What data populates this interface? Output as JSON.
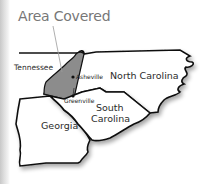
{
  "title": "Area Covered",
  "states": {
    "tennessee": "Tennessee",
    "north_carolina": "North Carolina",
    "south_carolina_1": "South",
    "south_carolina_2": "Carolina",
    "georgia": "Georgia"
  },
  "cities": {
    "asheville": "Asheville",
    "greenville": "Greenville"
  },
  "colors": {
    "covered_area": "#8c8c8c",
    "border": "#111111",
    "title": "#777777",
    "leader_line": "#9a9a9a"
  }
}
